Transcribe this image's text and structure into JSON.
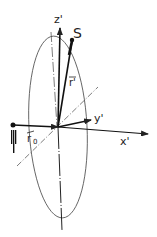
{
  "diagram": {
    "labels": {
      "z_axis": "z'",
      "y_axis": "y'",
      "x_axis": "x'",
      "source": "S",
      "r_vector": "r'",
      "r0_vector": "r",
      "r0_sub": "0"
    },
    "colors": {
      "stroke": "#222222",
      "background": "#ffffff"
    }
  }
}
